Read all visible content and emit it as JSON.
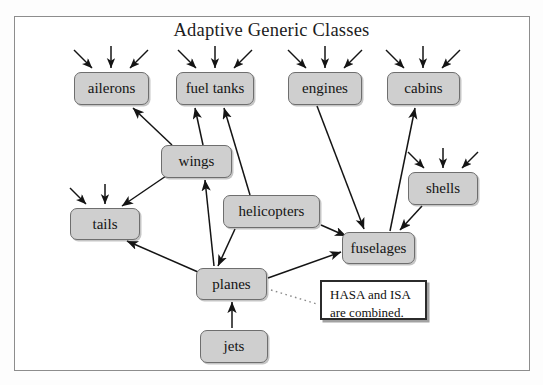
{
  "diagram": {
    "title": "Adaptive Generic Classes",
    "frame": {
      "x": 14,
      "y": 16,
      "w": 516,
      "h": 355
    },
    "style": {
      "node_fill": "#cfcfcf",
      "node_stroke": "#6e6e6e",
      "edge_stroke": "#1c1c1c",
      "note_stroke": "#2b2b2b",
      "frame_stroke": "#8d8d8d",
      "background": "#ffffff"
    },
    "nodes": [
      {
        "id": "ailerons",
        "label": "ailerons",
        "x": 74,
        "y": 72,
        "w": 75,
        "h": 33
      },
      {
        "id": "fueltanks",
        "label": "fuel tanks",
        "x": 176,
        "y": 72,
        "w": 78,
        "h": 33
      },
      {
        "id": "engines",
        "label": "engines",
        "x": 288,
        "y": 72,
        "w": 74,
        "h": 33
      },
      {
        "id": "cabins",
        "label": "cabins",
        "x": 387,
        "y": 72,
        "w": 73,
        "h": 33
      },
      {
        "id": "wings",
        "label": "wings",
        "x": 161,
        "y": 145,
        "w": 71,
        "h": 33
      },
      {
        "id": "shells",
        "label": "shells",
        "x": 408,
        "y": 172,
        "w": 70,
        "h": 33
      },
      {
        "id": "helicopters",
        "label": "helicopters",
        "x": 223,
        "y": 195,
        "w": 97,
        "h": 33
      },
      {
        "id": "tails",
        "label": "tails",
        "x": 70,
        "y": 208,
        "w": 70,
        "h": 32
      },
      {
        "id": "fuselages",
        "label": "fuselages",
        "x": 342,
        "y": 232,
        "w": 73,
        "h": 32
      },
      {
        "id": "planes",
        "label": "planes",
        "x": 196,
        "y": 268,
        "w": 71,
        "h": 32
      },
      {
        "id": "jets",
        "label": "jets",
        "x": 200,
        "y": 330,
        "w": 68,
        "h": 33
      }
    ],
    "note": {
      "id": "hasa-isa-note",
      "line1": "HASA and ISA",
      "line2": "are combined.",
      "x": 320,
      "y": 280,
      "w": 107,
      "h": 40
    },
    "adaptive_markers": [
      {
        "for": "ailerons",
        "x": 111
      },
      {
        "for": "fueltanks",
        "x": 215
      },
      {
        "for": "engines",
        "x": 325
      },
      {
        "for": "cabins",
        "x": 423
      },
      {
        "for": "shells",
        "x": 443
      },
      {
        "for": "tails",
        "x": 105
      }
    ],
    "edges": [
      {
        "from": "wings",
        "to": "ailerons"
      },
      {
        "from": "wings",
        "to": "fueltanks"
      },
      {
        "from": "helicopters",
        "to": "fueltanks"
      },
      {
        "from": "engines",
        "to": "fuselages"
      },
      {
        "from": "fuselages",
        "to": "cabins"
      },
      {
        "from": "shells",
        "to": "fuselages"
      },
      {
        "from": "wings",
        "to": "tails"
      },
      {
        "from": "planes",
        "to": "tails"
      },
      {
        "from": "helicopters",
        "to": "planes"
      },
      {
        "from": "planes",
        "to": "wings"
      },
      {
        "from": "helicopters",
        "to": "fuselages"
      },
      {
        "from": "planes",
        "to": "fuselages"
      },
      {
        "from": "jets",
        "to": "planes"
      }
    ]
  }
}
